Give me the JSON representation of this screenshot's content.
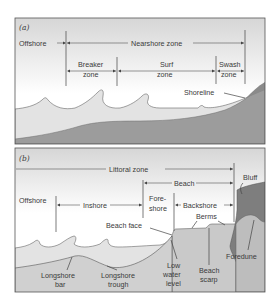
{
  "panels": [
    {
      "id": "a",
      "label": "(a)",
      "zones": {
        "offshore": "Offshore",
        "nearshore": "Nearshore zone",
        "breaker_1": "Breaker",
        "breaker_2": "zone",
        "surf_1": "Surf",
        "surf_2": "zone",
        "swash_1": "Swash",
        "swash_2": "zone"
      },
      "annotations": {
        "shoreline": "Shoreline"
      }
    },
    {
      "id": "b",
      "label": "(b)",
      "zones": {
        "littoral": "Littoral zone",
        "beach": "Beach",
        "offshore": "Offshore",
        "inshore": "Inshore",
        "foreshore_1": "Fore-",
        "foreshore_2": "shore",
        "backshore": "Backshore"
      },
      "annotations": {
        "bluff": "Bluff",
        "berms": "Berms",
        "beach_face": "Beach face",
        "foredune": "Foredune",
        "longshore_bar_1": "Longshore",
        "longshore_bar_2": "bar",
        "longshore_trough_1": "Longshore",
        "longshore_trough_2": "trough",
        "low_water_1": "Low",
        "low_water_2": "water",
        "low_water_3": "level",
        "beach_scarp_1": "Beach",
        "beach_scarp_2": "scarp"
      }
    }
  ],
  "colors": {
    "sky_top": "#dcdcdc",
    "sky_bottom": "#ffffff",
    "water": "#e6e6e6",
    "land": "#9a9a9a",
    "beach_sand": "#c8c8c8",
    "bluff": "#7a7a7a",
    "border": "#555555"
  }
}
